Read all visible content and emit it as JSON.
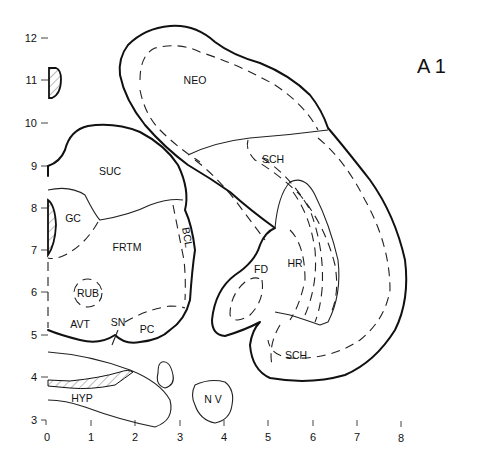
{
  "figure": {
    "title": "A 1",
    "type": "anatomical atlas section (brain coronal slice, stereotaxic coordinates)"
  },
  "axes": {
    "y_ticks": [
      "12",
      "11",
      "10",
      "9",
      "8",
      "7",
      "6",
      "5",
      "4",
      "3"
    ],
    "x_ticks": [
      "0",
      "1",
      "2",
      "3",
      "4",
      "5",
      "6",
      "7",
      "8"
    ]
  },
  "regions": {
    "neo": "NEO",
    "sch_upper": "SCH",
    "sch_lower": "SCH",
    "suc": "SUC",
    "gc": "GC",
    "frtm": "FRTM",
    "bcl": "BCL",
    "rub": "RUB",
    "avt": "AVT",
    "sn": "SN",
    "pc": "PC",
    "fd": "FD",
    "hr": "HR",
    "hyp": "HYP",
    "nv": "N V"
  }
}
